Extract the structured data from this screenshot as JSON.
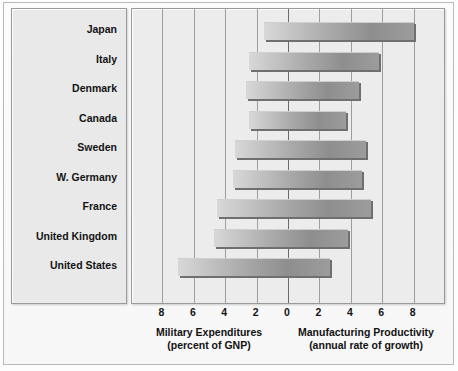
{
  "chart_data": {
    "type": "bar",
    "orientation": "horizontal-diverging",
    "title": "",
    "categories": [
      "Japan",
      "Italy",
      "Denmark",
      "Canada",
      "Sweden",
      "W. Germany",
      "France",
      "United Kingdom",
      "United States"
    ],
    "series": [
      {
        "name": "Military Expenditures",
        "axis_label": "Military Expenditures",
        "axis_sublabel": "(percent of GNP)",
        "direction": "left",
        "values": [
          1.5,
          2.5,
          2.7,
          2.5,
          3.4,
          3.5,
          4.5,
          4.7,
          7.0
        ]
      },
      {
        "name": "Manufacturing Productivity",
        "axis_label": "Manufacturing Productivity",
        "axis_sublabel": "(annual rate of growth)",
        "direction": "right",
        "values": [
          8.0,
          5.8,
          4.5,
          3.7,
          5.0,
          4.7,
          5.3,
          3.8,
          2.7
        ]
      }
    ],
    "tick_values_left": [
      8,
      6,
      4,
      2
    ],
    "tick_values_right": [
      2,
      4,
      6,
      8
    ],
    "zero_tick": 0,
    "tick_labels": [
      "8",
      "6",
      "4",
      "2",
      "0",
      "2",
      "4",
      "6",
      "8"
    ],
    "xlim": [
      -9.2,
      9.2
    ],
    "grid": true,
    "legend": "none",
    "colors": {
      "bar_light": "#d8d8d8",
      "bar_dark": "#8e8e8e",
      "bar_shadow": "#6f6f6f",
      "panel_bg": "#ececec",
      "label_panel_bg": "#e9e9e9",
      "gridline": "#9d9d9d",
      "zero_line": "#6a6a6a",
      "text": "#141414",
      "frame_border": "#9a9a9a"
    }
  },
  "axis": {
    "left_caption": "Military Expenditures",
    "left_caption_sub": "(percent of GNP)",
    "right_caption": "Manufacturing Productivity",
    "right_caption_sub": "(annual rate of growth)"
  }
}
